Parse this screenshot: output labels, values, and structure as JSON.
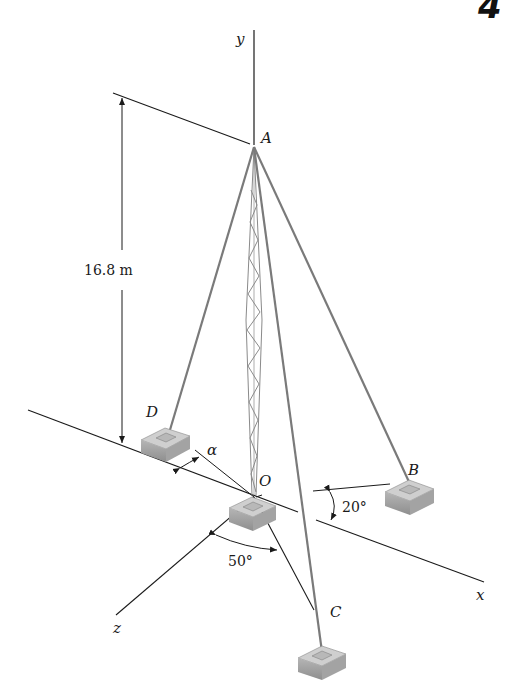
{
  "figure": {
    "corner_glyph": "4",
    "axes": {
      "x": "x",
      "y": "y",
      "z": "z"
    },
    "points": {
      "A": "A",
      "B": "B",
      "C": "C",
      "D": "D",
      "O": "O"
    },
    "dimensions": {
      "height": "16.8 m",
      "angle_alpha": "α",
      "angle_20": "20°",
      "angle_50": "50°"
    },
    "colors": {
      "line": "#1a1a1a",
      "cable": "#7a7a7a",
      "base_top": "#c8c8c8",
      "base_side": "#9a9a9a",
      "background": "#ffffff"
    }
  }
}
